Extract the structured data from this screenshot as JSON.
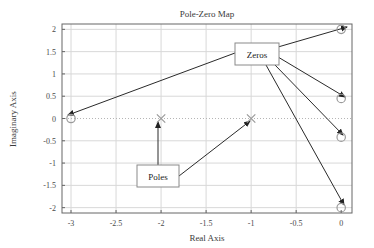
{
  "chart_data": {
    "type": "scatter",
    "title": "Pole-Zero Map",
    "xlabel": "Real Axis",
    "ylabel": "Imaginary Axis",
    "xlim": [
      -3.1,
      0.12
    ],
    "ylim": [
      -2.12,
      2.12
    ],
    "grid": true,
    "legend": "none",
    "xticks": [
      "-3",
      "-2.5",
      "-2",
      "-1.5",
      "-1",
      "-0.5",
      "0"
    ],
    "xtick_values": [
      -3,
      -2.5,
      -2,
      -1.5,
      -1,
      -0.5,
      0
    ],
    "yticks": [
      "2",
      "1.5",
      "1",
      "0.5",
      "0",
      "-0.5",
      "-1",
      "-1.5",
      "-2"
    ],
    "ytick_values": [
      2,
      1.5,
      1,
      0.5,
      0,
      -0.5,
      -1,
      -1.5,
      -2
    ],
    "series": [
      {
        "name": "Zeros",
        "marker": "circle",
        "color": "#9a9a9a",
        "points": [
          {
            "x": -3,
            "y": 0
          },
          {
            "x": 0,
            "y": 2
          },
          {
            "x": 0,
            "y": 0.45
          },
          {
            "x": 0,
            "y": -0.42
          },
          {
            "x": 0,
            "y": -2
          }
        ]
      },
      {
        "name": "Poles",
        "marker": "x",
        "color": "#9a9a9a",
        "points": [
          {
            "x": -2,
            "y": 0
          },
          {
            "x": -1,
            "y": 0
          }
        ]
      }
    ],
    "annotations": [
      {
        "label": "Zeros",
        "box_x": 235,
        "box_y": 43,
        "box_w": 44,
        "box_h": 22,
        "arrows": [
          {
            "from_x": 235,
            "from_y": 53,
            "to_x": 68,
            "to_y": 115
          },
          {
            "from_x": 278,
            "from_y": 47,
            "to_x": 347,
            "to_y": 27
          },
          {
            "from_x": 278,
            "from_y": 57,
            "to_x": 345,
            "to_y": 97
          },
          {
            "from_x": 275,
            "from_y": 65,
            "to_x": 343,
            "to_y": 135
          },
          {
            "from_x": 266,
            "from_y": 65,
            "to_x": 344,
            "to_y": 205
          }
        ]
      },
      {
        "label": "Poles",
        "box_x": 137,
        "box_y": 165,
        "box_w": 42,
        "box_h": 22,
        "arrows": [
          {
            "from_x": 158,
            "from_y": 165,
            "to_x": 158,
            "to_y": 122
          },
          {
            "from_x": 179,
            "from_y": 176,
            "to_x": 250,
            "to_y": 121
          }
        ]
      }
    ]
  },
  "plot_box": {
    "left": 62,
    "top": 24,
    "right": 352,
    "bottom": 213
  }
}
